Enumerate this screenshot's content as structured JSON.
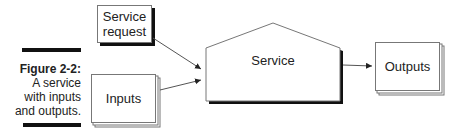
{
  "caption": {
    "figure_label": "Figure 2-2:",
    "text_lines": [
      "A service",
      "with inputs",
      "and outputs."
    ]
  },
  "nodes": {
    "service_request": {
      "label_line1": "Service",
      "label_line2": "request"
    },
    "inputs": {
      "label": "Inputs"
    },
    "service": {
      "label": "Service"
    },
    "outputs": {
      "label": "Outputs"
    }
  },
  "edges": [
    {
      "from": "service_request",
      "to": "service"
    },
    {
      "from": "inputs",
      "to": "service"
    },
    {
      "from": "service",
      "to": "outputs"
    }
  ]
}
